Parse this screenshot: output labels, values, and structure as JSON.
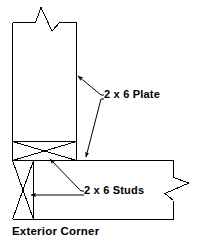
{
  "figure": {
    "caption": "Exterior Corner",
    "type": "architectural-detail-drawing",
    "colors": {
      "line": "#000000",
      "background": "#ffffff",
      "text": "#000000"
    }
  },
  "labels": {
    "plate": "2 x 6 Plate",
    "studs": "2 x 6 Studs"
  },
  "annotations": [
    {
      "id": "plate-upper",
      "text": "2 x 6 Plate",
      "points_to": "vertical-wall-right-face",
      "arrow": "up-left"
    },
    {
      "id": "plate-lower",
      "text": "2 x 6 Plate",
      "points_to": "horizontal-wall-top-face",
      "arrow": "down"
    },
    {
      "id": "studs-upper",
      "text": "2 x 6 Studs",
      "points_to": "corner-stud-pack",
      "arrow": "up-left"
    },
    {
      "id": "studs-lower",
      "text": "2 x 6 Studs",
      "points_to": "vertical-stud-column",
      "arrow": "left"
    }
  ],
  "elements": {
    "vertical_wall": "2 x 6 stud wall shown in plan, running upward",
    "horizontal_wall": "2 x 6 stud wall shown in plan, running to the right",
    "break_symbol_top": "zigzag break line at top of vertical wall",
    "break_symbol_right": "zigzag break line at right of horizontal wall",
    "x_brace_horizontal": "cross-hatched plate block at wall intersection",
    "x_brace_vertical": "cross-hatched stud block below intersection"
  }
}
